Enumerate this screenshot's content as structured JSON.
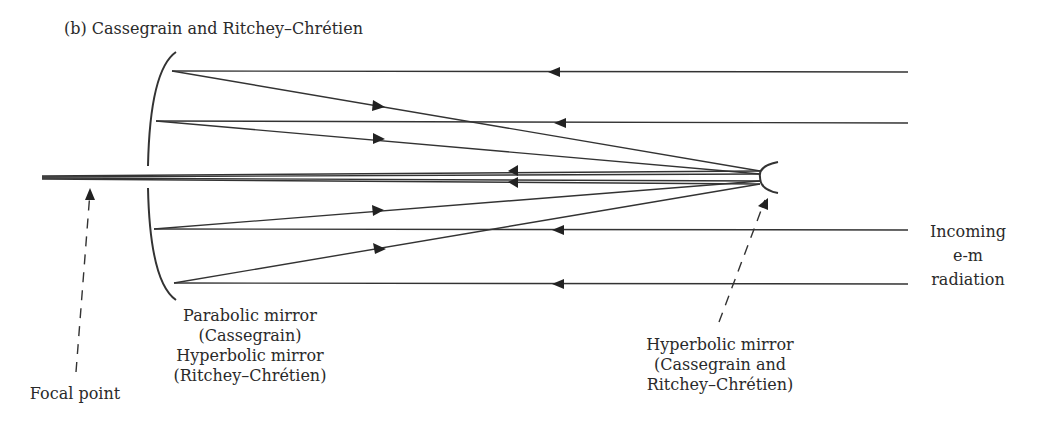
{
  "title": "(b) Cassegrain and Ritchey–Chrétien",
  "labels": {
    "primary_mirror": [
      "Parabolic mirror",
      "(Cassegrain)",
      "Hyperbolic mirror",
      "(Ritchey–Chrétien)"
    ],
    "secondary_mirror": [
      "Hyperbolic mirror",
      "(Cassegrain and",
      "Ritchey–Chrétien)"
    ],
    "focal_point": "Focal point",
    "incoming": [
      "Incoming",
      "e-m",
      "radiation"
    ]
  },
  "colors": {
    "line": "#333333",
    "background": "#ffffff"
  }
}
